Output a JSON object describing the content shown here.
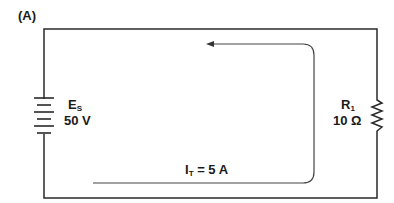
{
  "figure": {
    "panel_label": "(A)"
  },
  "source": {
    "name": "E",
    "subscript": "S",
    "value": "50 V"
  },
  "resistor": {
    "name": "R",
    "subscript": "1",
    "value": "10 Ω"
  },
  "current": {
    "name": "I",
    "subscript": "T",
    "equation": "= 5 A"
  },
  "colors": {
    "wire": "#2a2a2a",
    "arrow": "#444444"
  }
}
